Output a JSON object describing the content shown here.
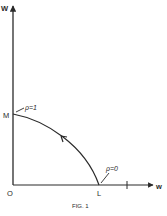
{
  "figure": {
    "caption": "FIG. 1",
    "axes": {
      "y_label": "W",
      "x_label": "w",
      "origin_label": "O"
    },
    "points": {
      "M": "M",
      "L": "L",
      "tick_label": "I"
    },
    "annotations": {
      "rho_one": "ρ=1",
      "rho_zero": "ρ=0"
    },
    "colors": {
      "ink": "#2a2a2a",
      "background": "#ffffff"
    }
  }
}
